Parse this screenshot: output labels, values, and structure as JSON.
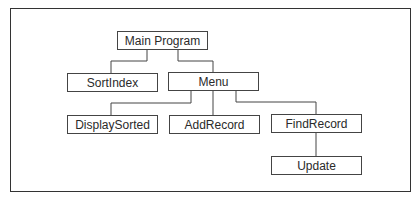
{
  "diagram": {
    "type": "hierarchy-chart",
    "nodes": {
      "main_program": "Main Program",
      "sort_index": "SortIndex",
      "menu": "Menu",
      "display_sorted": "DisplaySorted",
      "add_record": "AddRecord",
      "find_record": "FindRecord",
      "update": "Update"
    },
    "edges": [
      {
        "from": "Main Program",
        "to": "SortIndex"
      },
      {
        "from": "Main Program",
        "to": "Menu"
      },
      {
        "from": "Menu",
        "to": "DisplaySorted"
      },
      {
        "from": "Menu",
        "to": "AddRecord"
      },
      {
        "from": "Menu",
        "to": "FindRecord"
      },
      {
        "from": "FindRecord",
        "to": "Update"
      }
    ],
    "colors": {
      "line": "#444444",
      "text": "#2a2a2a",
      "background": "#ffffff"
    }
  }
}
